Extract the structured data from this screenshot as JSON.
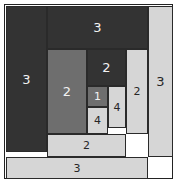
{
  "figure": {
    "width": 177,
    "height": 183,
    "background": "#ffffff",
    "frame_color": "#222222",
    "stroke_color": "#2a2a2a",
    "palette": {
      "dark": "#333333",
      "mid": "#6e6e6e",
      "light": "#d6d6d6",
      "label_on_dark": "#f2f2f2",
      "label_on_light": "#262626"
    }
  },
  "chart_data": {
    "type": "diagram",
    "xlabel": "",
    "ylabel": "",
    "grid": false,
    "legend": "none",
    "xlim": [
      0,
      177
    ],
    "ylim": [
      0,
      183
    ],
    "categories": [
      "3",
      "3",
      "3",
      "3",
      "2",
      "2",
      "2",
      "2",
      "1",
      "4",
      "4"
    ],
    "values": [
      3,
      3,
      3,
      3,
      2,
      2,
      2,
      2,
      1,
      4,
      4
    ],
    "tiles": [
      {
        "id": "tile-left-3",
        "label": "3",
        "tone": "dark",
        "ink": "light",
        "x": 5,
        "y": 5,
        "w": 41,
        "h": 146
      },
      {
        "id": "tile-top-3",
        "label": "3",
        "tone": "dark",
        "ink": "light",
        "x": 46,
        "y": 5,
        "w": 101,
        "h": 43
      },
      {
        "id": "tile-right-3",
        "label": "3",
        "tone": "light",
        "ink": "dark",
        "x": 147,
        "y": 5,
        "w": 25,
        "h": 151
      },
      {
        "id": "tile-bottom-3",
        "label": "3",
        "tone": "light",
        "ink": "dark",
        "x": 5,
        "y": 156,
        "w": 142,
        "h": 22
      },
      {
        "id": "tile-mid-left-2",
        "label": "2",
        "tone": "mid",
        "ink": "light",
        "x": 46,
        "y": 48,
        "w": 40,
        "h": 85
      },
      {
        "id": "tile-upper-mid-2",
        "label": "2",
        "tone": "dark",
        "ink": "light",
        "x": 86,
        "y": 48,
        "w": 39,
        "h": 37
      },
      {
        "id": "tile-right-inner-2",
        "label": "2",
        "tone": "light",
        "ink": "dark",
        "x": 125,
        "y": 48,
        "w": 22,
        "h": 85
      },
      {
        "id": "tile-bottom-strip-2",
        "label": "2",
        "tone": "light",
        "ink": "dark",
        "x": 46,
        "y": 133,
        "w": 79,
        "h": 23
      },
      {
        "id": "tile-center-1",
        "label": "1",
        "tone": "mid",
        "ink": "light",
        "x": 86,
        "y": 85,
        "w": 21,
        "h": 21
      },
      {
        "id": "tile-right-4",
        "label": "4",
        "tone": "light",
        "ink": "dark",
        "x": 107,
        "y": 85,
        "w": 18,
        "h": 42
      },
      {
        "id": "tile-lower-4",
        "label": "4",
        "tone": "light",
        "ink": "dark",
        "x": 86,
        "y": 106,
        "w": 21,
        "h": 27
      }
    ]
  }
}
